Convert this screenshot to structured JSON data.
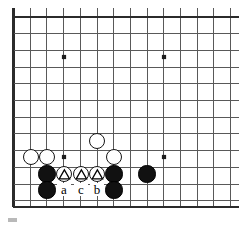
{
  "figure": {
    "kind": "go-board-diagram",
    "background_color": "#ffffff",
    "line_color": "#595959",
    "edge_color": "#2b2b2b",
    "black_color": "#111111",
    "white_color": "#ffffff",
    "label_color": "#000000"
  },
  "board": {
    "origin_x": 13.5,
    "origin_y": 17.0,
    "spacing": 16.7,
    "cols": 14,
    "rows": 12,
    "left_edge_x": 13.5,
    "top_edge_y": 17.0,
    "bottom_edge_y": 207.0,
    "edge_line_width": 2.2,
    "grid_line_width": 1.0,
    "clipped_right": true,
    "clipped_top_stub": true,
    "star_points": [
      {
        "name": "star-upper-left",
        "cx": 64,
        "cy": 57
      },
      {
        "name": "star-upper-right",
        "cx": 164,
        "cy": 57
      },
      {
        "name": "star-lower-left",
        "cx": 64,
        "cy": 157
      },
      {
        "name": "star-lower-right",
        "cx": 164,
        "cy": 157
      }
    ],
    "star_size": 4.2
  },
  "stones": [
    {
      "id": "white-1",
      "color": "white",
      "cx": 31,
      "cy": 157,
      "r": 8.4,
      "mark": "none",
      "label": ""
    },
    {
      "id": "white-2",
      "color": "white",
      "cx": 47,
      "cy": 157,
      "r": 8.4,
      "mark": "none",
      "label": ""
    },
    {
      "id": "white-3",
      "color": "white",
      "cx": 97,
      "cy": 141,
      "r": 8.4,
      "mark": "none",
      "label": ""
    },
    {
      "id": "white-4",
      "color": "white",
      "cx": 114,
      "cy": 157,
      "r": 8.4,
      "mark": "none",
      "label": ""
    },
    {
      "id": "white-tri-a",
      "color": "white",
      "cx": 64,
      "cy": 174,
      "r": 8.4,
      "mark": "triangle",
      "label": ""
    },
    {
      "id": "white-tri-c",
      "color": "white",
      "cx": 81,
      "cy": 174,
      "r": 8.4,
      "mark": "triangle",
      "label": ""
    },
    {
      "id": "white-tri-b",
      "color": "white",
      "cx": 97,
      "cy": 174,
      "r": 8.4,
      "mark": "triangle",
      "label": ""
    },
    {
      "id": "black-1",
      "color": "black",
      "cx": 47,
      "cy": 174,
      "r": 8.6,
      "mark": "none",
      "label": ""
    },
    {
      "id": "black-2",
      "color": "black",
      "cx": 47,
      "cy": 190,
      "r": 8.6,
      "mark": "none",
      "label": ""
    },
    {
      "id": "black-3",
      "color": "black",
      "cx": 114,
      "cy": 174,
      "r": 8.6,
      "mark": "none",
      "label": ""
    },
    {
      "id": "black-4",
      "color": "black",
      "cx": 114,
      "cy": 190,
      "r": 8.6,
      "mark": "none",
      "label": ""
    },
    {
      "id": "black-5",
      "color": "black",
      "cx": 147,
      "cy": 174,
      "r": 8.6,
      "mark": "none",
      "label": ""
    }
  ],
  "point_labels": [
    {
      "id": "label-a",
      "text": "a",
      "cx": 64,
      "cy": 191,
      "font_size": 13
    },
    {
      "id": "label-c",
      "text": "c",
      "cx": 81,
      "cy": 191,
      "font_size": 13
    },
    {
      "id": "label-b",
      "text": "b",
      "cx": 97,
      "cy": 191,
      "font_size": 13
    }
  ],
  "artifacts": [
    {
      "id": "scan-speck",
      "x": 8,
      "y": 218,
      "w": 9,
      "h": 4,
      "color": "#b9b9b9"
    }
  ]
}
